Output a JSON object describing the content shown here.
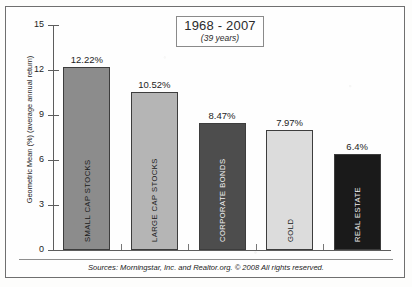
{
  "chart_data": {
    "type": "bar",
    "title": "1968 - 2007",
    "subtitle": "(39 years)",
    "xlabel": "",
    "ylabel": "Geometric Mean (%) (average annual return)",
    "ylim": [
      0,
      15
    ],
    "ytick_values": [
      0,
      3,
      6,
      9,
      12,
      15
    ],
    "ytick_labels": [
      "0",
      "3",
      "6",
      "9",
      "12",
      "15"
    ],
    "grid": false,
    "legend": "none",
    "categories": [
      "SMALL CAP STOCKS",
      "LARGE CAP STOCKS",
      "CORPORATE BONDS",
      "GOLD",
      "REAL ESTATE"
    ],
    "values": [
      12.22,
      10.52,
      8.47,
      7.97,
      6.4
    ],
    "value_labels": [
      "12.22%",
      "10.52%",
      "8.47%",
      "7.97%",
      "6.4%"
    ],
    "bar_colors": [
      "#8c8c8c",
      "#b5b5b5",
      "#4d4d4d",
      "#dcdcdc",
      "#1a1a1a"
    ],
    "bar_label_colors": [
      "#1a1a1a",
      "#1a1a1a",
      "#f2f2f2",
      "#1a1a1a",
      "#f2f2f2"
    ],
    "source_note": "Sources: Morningstar, Inc. and Realtor.org. © 2008  All rights reserved."
  }
}
